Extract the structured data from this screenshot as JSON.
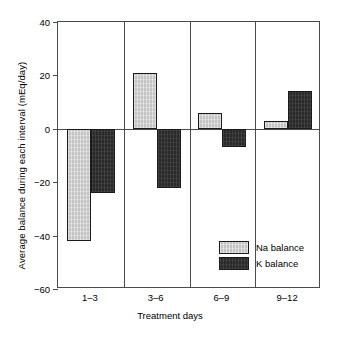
{
  "chart_data": {
    "type": "bar",
    "title": "",
    "xlabel": "Treatment days",
    "ylabel": "Average balance during each interval (mEq/day)",
    "categories": [
      "1–3",
      "3–6",
      "6–9",
      "9–12"
    ],
    "series": [
      {
        "name": "Na balance",
        "color": "#c3c3c3",
        "values": [
          -42,
          21,
          6,
          3
        ]
      },
      {
        "name": "K balance",
        "color": "#2a2a2a",
        "values": [
          -24,
          -22,
          -7,
          14
        ]
      }
    ],
    "ylim": [
      -60,
      40
    ],
    "yticks": [
      40,
      20,
      0,
      -20,
      -40,
      -60
    ],
    "ytick_labels": [
      "40",
      "20",
      "0",
      "−20",
      "−40",
      "−60"
    ],
    "grid": false,
    "legend_position": "inside-bottom-right",
    "group_separators": true,
    "zero_line": true
  },
  "legend": {
    "entries": [
      {
        "label": "Na balance",
        "swatch": "na-swatch"
      },
      {
        "label": "K balance",
        "swatch": "k-swatch"
      }
    ]
  },
  "axes": {
    "y_title": "Average balance during each interval (mEq/day)",
    "x_title": "Treatment days"
  }
}
